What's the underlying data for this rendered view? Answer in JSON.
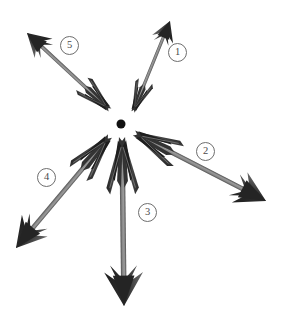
{
  "figure": {
    "kind": "radial-arrow-diagram",
    "background_color": "#ffffff",
    "center_dot": {
      "name": "center-point",
      "x": 121,
      "y": 124,
      "diameter": 9,
      "color": "#111111"
    },
    "shaft_color": "#8a8a8a",
    "shaft_edge_color": "#4f4f4f",
    "feather_color": "#3a3a3a",
    "head_color": "#2e2e2e",
    "label_ring_color": "#6e6e6e",
    "label_text_color": "#4a4a4a"
  },
  "arrows": [
    {
      "id": "arrow-1",
      "number": "1",
      "tail_x": 133,
      "tail_y": 112,
      "tip_x": 170,
      "tip_y": 21,
      "label_x": 177,
      "label_y": 53
    },
    {
      "id": "arrow-2",
      "number": "2",
      "tail_x": 134,
      "tail_y": 133,
      "tip_x": 266,
      "tip_y": 201,
      "label_x": 205,
      "label_y": 152
    },
    {
      "id": "arrow-3",
      "number": "3",
      "tail_x": 122,
      "tail_y": 137,
      "tip_x": 124,
      "tip_y": 306,
      "label_x": 147,
      "label_y": 213
    },
    {
      "id": "arrow-4",
      "number": "4",
      "tail_x": 110,
      "tail_y": 136,
      "tip_x": 16,
      "tip_y": 248,
      "label_x": 46,
      "label_y": 178
    },
    {
      "id": "arrow-5",
      "number": "5",
      "tail_x": 110,
      "tail_y": 110,
      "tip_x": 27,
      "tip_y": 33,
      "label_x": 69,
      "label_y": 46
    }
  ],
  "labels": [
    {
      "text": "1"
    },
    {
      "text": "2"
    },
    {
      "text": "3"
    },
    {
      "text": "4"
    },
    {
      "text": "5"
    }
  ]
}
